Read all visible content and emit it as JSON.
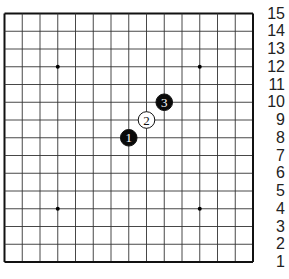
{
  "board": {
    "size": 15,
    "line_color": "#333333",
    "border_color": "#111111",
    "background": "#ffffff",
    "star_points": [
      [
        4,
        4
      ],
      [
        4,
        12
      ],
      [
        12,
        4
      ],
      [
        12,
        12
      ]
    ],
    "row_labels": [
      "15",
      "14",
      "13",
      "12",
      "11",
      "10",
      "9",
      "8",
      "7",
      "6",
      "5",
      "4",
      "3",
      "2",
      "1"
    ],
    "stones": [
      {
        "move": "1",
        "color": "black",
        "col": 8,
        "row": 8
      },
      {
        "move": "2",
        "color": "white",
        "col": 9,
        "row": 9
      },
      {
        "move": "3",
        "color": "black",
        "col": 10,
        "row": 10
      }
    ]
  }
}
